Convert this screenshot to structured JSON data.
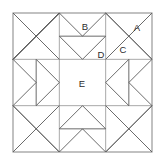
{
  "figure": {
    "name": "quilt-block-diagram",
    "title": "",
    "background_color": "#ffffff",
    "line_color": "#5a5a5a",
    "frame_color": "#8f8f8f",
    "grid_color": "#9a9a9a",
    "label_color": "#2b2b2b"
  },
  "geometry": {
    "frame": {
      "x0": 13,
      "y0": 13,
      "x1": 152,
      "y1": 152
    },
    "grid_x": [
      13,
      59.33,
      105.67,
      152
    ],
    "grid_y": [
      13,
      59.33,
      105.67,
      152
    ],
    "cells": 3
  },
  "labels": [
    {
      "id": "A",
      "text": "A",
      "x": 137,
      "y": 28
    },
    {
      "id": "B",
      "text": "B",
      "x": 85,
      "y": 27
    },
    {
      "id": "C",
      "text": "C",
      "x": 123,
      "y": 50
    },
    {
      "id": "D",
      "text": "D",
      "x": 101,
      "y": 55
    },
    {
      "id": "E",
      "text": "E",
      "x": 82,
      "y": 84
    }
  ]
}
